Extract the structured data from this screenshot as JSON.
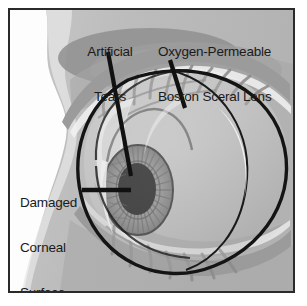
{
  "figure": {
    "border_color": "#2a2a2a",
    "background_color": "#b4b4b4"
  },
  "labels": {
    "artificial_tears": {
      "line1": "Artificial",
      "line2": "Tears"
    },
    "scleral_lens": {
      "line1": "Oxygen-Permeable",
      "line2": "Boston Sceral Lens"
    },
    "damaged_cornea": {
      "line1": "Damaged",
      "line2": "Corneal",
      "line3": "Surface"
    }
  },
  "colors": {
    "skin_light": "#c2c2c2",
    "skin_mid": "#b0b0b0",
    "skin_shadow": "#9a9a9a",
    "brow_shadow": "#8e8e8e",
    "face_highlight": "#fdfdfd",
    "sclera": "#c9c9c9",
    "sclera_shadow": "#a8a8a8",
    "lens_fill": "#bdbdbd",
    "lens_highlight": "#ededed",
    "iris": "#8f8f8f",
    "iris_stria": "#6a6a6a",
    "pupil": "#141414",
    "outline": "#141414",
    "lash": "#909090",
    "tear_film": "#f4f4f4",
    "label_text": "#1a1a1a",
    "leader_line": "#111111"
  },
  "leader_lines": [
    {
      "name": "artificial-tears-leader",
      "x1": 98,
      "y1": 42,
      "x2": 121,
      "y2": 166
    },
    {
      "name": "scleral-lens-leader",
      "x1": 160,
      "y1": 50,
      "x2": 175,
      "y2": 98
    },
    {
      "name": "damaged-cornea-leader",
      "x1": 80,
      "y1": 180,
      "x2": 121,
      "y2": 180
    }
  ],
  "anatomy": {
    "parts": [
      "face-profile",
      "brow-shadow",
      "upper-eyelid",
      "lower-eyelid",
      "eyelashes-upper",
      "eyelashes-lower",
      "sclera",
      "cornea",
      "iris",
      "pupil",
      "scleral-lens-dome",
      "tear-reservoir"
    ]
  }
}
